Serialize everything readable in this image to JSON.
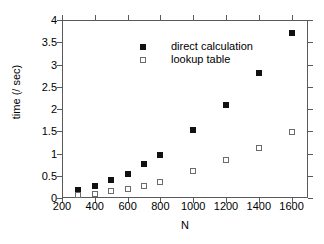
{
  "chart_data": {
    "type": "scatter",
    "title": "",
    "xlabel": "N",
    "ylabel": "time (/ sec)",
    "xlim": [
      200,
      1700
    ],
    "ylim": [
      0,
      4
    ],
    "grid": false,
    "legend_position": "top-left-inside",
    "xticks": [
      200,
      400,
      600,
      800,
      1000,
      1200,
      1400,
      1600
    ],
    "xtick_labels": [
      "200",
      "400",
      "600",
      "800",
      "1000",
      "1200",
      "1400",
      "1600"
    ],
    "yticks": [
      0,
      0.5,
      1,
      1.5,
      2,
      2.5,
      3,
      3.5,
      4
    ],
    "ytick_labels": [
      "0",
      "0.5",
      "1",
      "1.5",
      "2",
      "2.5",
      "3",
      "3.5",
      "4"
    ],
    "x": [
      300,
      400,
      500,
      600,
      700,
      800,
      1000,
      1200,
      1400,
      1600
    ],
    "series": [
      {
        "name": "direct calculation",
        "marker": "filled-square",
        "color": "#111111",
        "values": [
          0.17,
          0.27,
          0.4,
          0.55,
          0.77,
          0.96,
          1.52,
          2.09,
          2.82,
          3.7
        ]
      },
      {
        "name": "lookup table",
        "marker": "open-square",
        "color": "#6b6b6b",
        "values": [
          0.06,
          0.1,
          0.15,
          0.21,
          0.27,
          0.37,
          0.61,
          0.85,
          1.13,
          1.49
        ]
      }
    ]
  }
}
